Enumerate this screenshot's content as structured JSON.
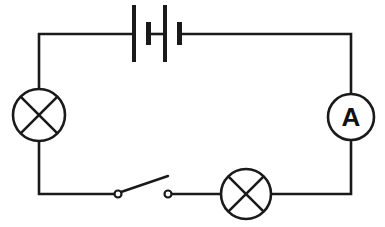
{
  "diagram": {
    "type": "electrical circuit schematic",
    "topology": "series loop",
    "colors": {
      "line": "#1a1a1a",
      "background": "#ffffff"
    },
    "components": {
      "battery": {
        "name": "battery",
        "cells": 2,
        "position": "top"
      },
      "lamp_left": {
        "name": "lamp",
        "symbol": "circle with X",
        "position": "left"
      },
      "ammeter": {
        "name": "ammeter",
        "label": "A",
        "position": "right"
      },
      "switch": {
        "name": "switch",
        "state": "open",
        "position": "bottom-left"
      },
      "lamp_bottom": {
        "name": "lamp",
        "symbol": "circle with X",
        "position": "bottom-right"
      }
    }
  }
}
